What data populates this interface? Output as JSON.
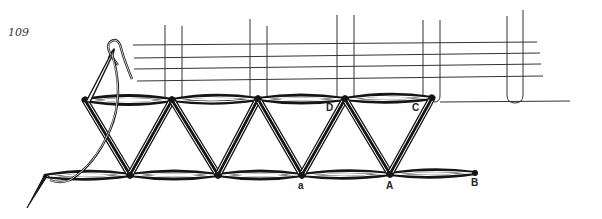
{
  "figure": {
    "number": "109",
    "labels": {
      "D": "D",
      "C": "C",
      "a": "a",
      "A": "A",
      "B": "B"
    }
  },
  "colors": {
    "background": "#ffffff",
    "ink": "#151515"
  }
}
